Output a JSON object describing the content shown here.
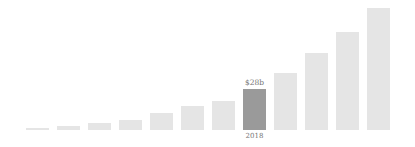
{
  "chart_data": {
    "type": "bar",
    "title": "",
    "xlabel": "",
    "ylabel": "",
    "legend": "none",
    "grid": false,
    "axes_visible": false,
    "background": "#ffffff",
    "categories": [
      "",
      "",
      "",
      "",
      "",
      "",
      "",
      "2018",
      "",
      "",
      "",
      ""
    ],
    "values_estimated_billions": [
      2,
      3,
      5,
      7,
      11,
      16,
      20,
      28,
      38,
      52,
      66,
      82
    ],
    "bar_heights_px": [
      2.5,
      4.5,
      7,
      10,
      17,
      24,
      29,
      41,
      57,
      77,
      98,
      122
    ],
    "highlight": {
      "index": 7,
      "value_label": "$28b",
      "year_label": "2018"
    },
    "colors": {
      "bar": "#e5e5e5",
      "highlight_bar": "#9a9a9a",
      "label_text": "#767676"
    }
  }
}
